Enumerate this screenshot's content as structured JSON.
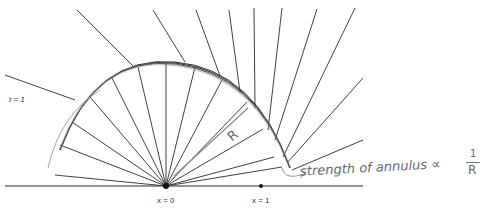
{
  "labels": {
    "t_label": "t = 1",
    "x0_label": "x = 0",
    "x1_label": "x = 1",
    "radius_label": "R",
    "annotation": "strength of annulus ∝",
    "annotation_frac_num": "1",
    "annotation_frac_den": "R"
  },
  "geometry": {
    "origin": [
      166,
      186
    ],
    "point_x1": [
      261,
      186
    ],
    "baseline": [
      5,
      363
    ],
    "arc_center": [
      166,
      186
    ],
    "arc_radius": 120,
    "inner_rays": [
      [
        55,
        175
      ],
      [
        60,
        145
      ],
      [
        72,
        122
      ],
      [
        90,
        97
      ],
      [
        112,
        78
      ],
      [
        138,
        67
      ],
      [
        166,
        63
      ],
      [
        195,
        67
      ],
      [
        222,
        80
      ],
      [
        247,
        102
      ],
      [
        263,
        129
      ],
      [
        274,
        157
      ],
      [
        282,
        167
      ]
    ],
    "outer_rays": [
      [
        [
          75,
          100
        ],
        [
          5,
          75
        ]
      ],
      [
        [
          135,
          68
        ],
        [
          77,
          10
        ]
      ],
      [
        [
          185,
          62
        ],
        [
          153,
          10
        ]
      ],
      [
        [
          220,
          76
        ],
        [
          196,
          10
        ]
      ],
      [
        [
          240,
          92
        ],
        [
          229,
          10
        ]
      ],
      [
        [
          255,
          108
        ],
        [
          254,
          8
        ]
      ],
      [
        [
          268,
          130
        ],
        [
          282,
          8
        ]
      ],
      [
        [
          275,
          140
        ],
        [
          317,
          9
        ]
      ],
      [
        [
          283,
          157
        ],
        [
          355,
          8
        ]
      ],
      [
        [
          287,
          163
        ],
        [
          363,
          78
        ]
      ],
      [
        [
          292,
          170
        ],
        [
          363,
          140
        ]
      ]
    ]
  },
  "colors": {
    "line": "#2a2a2a",
    "pencil": "#8a8a8a",
    "text": "#333333"
  }
}
